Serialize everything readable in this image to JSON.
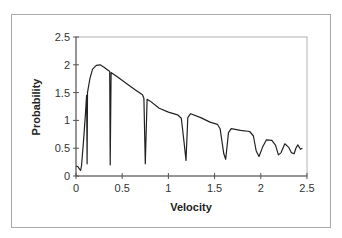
{
  "chart_data": {
    "type": "line",
    "title": "",
    "xlabel": "Velocity",
    "ylabel": "Probability",
    "xlim": [
      0,
      2.5
    ],
    "ylim": [
      0,
      2.5
    ],
    "x_ticks": [
      "0",
      "0.5",
      "1",
      "1.5",
      "2",
      "2.5"
    ],
    "y_ticks": [
      "0",
      "0.5",
      "1",
      "1.5",
      "2",
      "2.5"
    ],
    "grid": false,
    "legend": null,
    "series": [
      {
        "name": "Probability",
        "color": "#222222",
        "points": [
          [
            0.0,
            0.18
          ],
          [
            0.02,
            0.17
          ],
          [
            0.04,
            0.12
          ],
          [
            0.05,
            0.1
          ],
          [
            0.06,
            0.18
          ],
          [
            0.08,
            0.6
          ],
          [
            0.1,
            1.05
          ],
          [
            0.115,
            1.45
          ],
          [
            0.12,
            0.22
          ],
          [
            0.125,
            1.5
          ],
          [
            0.15,
            1.75
          ],
          [
            0.18,
            1.92
          ],
          [
            0.22,
            1.99
          ],
          [
            0.26,
            2.0
          ],
          [
            0.3,
            1.96
          ],
          [
            0.35,
            1.9
          ],
          [
            0.365,
            1.88
          ],
          [
            0.37,
            0.2
          ],
          [
            0.38,
            1.86
          ],
          [
            0.45,
            1.78
          ],
          [
            0.55,
            1.66
          ],
          [
            0.65,
            1.54
          ],
          [
            0.72,
            1.46
          ],
          [
            0.735,
            1.4
          ],
          [
            0.75,
            0.22
          ],
          [
            0.77,
            1.38
          ],
          [
            0.8,
            1.35
          ],
          [
            0.9,
            1.22
          ],
          [
            1.0,
            1.15
          ],
          [
            1.1,
            1.1
          ],
          [
            1.14,
            1.04
          ],
          [
            1.17,
            0.6
          ],
          [
            1.19,
            0.28
          ],
          [
            1.21,
            1.05
          ],
          [
            1.24,
            1.12
          ],
          [
            1.35,
            1.05
          ],
          [
            1.45,
            0.97
          ],
          [
            1.53,
            0.93
          ],
          [
            1.56,
            0.85
          ],
          [
            1.6,
            0.4
          ],
          [
            1.62,
            0.3
          ],
          [
            1.65,
            0.78
          ],
          [
            1.68,
            0.85
          ],
          [
            1.78,
            0.82
          ],
          [
            1.88,
            0.8
          ],
          [
            1.92,
            0.72
          ],
          [
            1.95,
            0.45
          ],
          [
            1.98,
            0.35
          ],
          [
            2.02,
            0.52
          ],
          [
            2.06,
            0.65
          ],
          [
            2.12,
            0.64
          ],
          [
            2.16,
            0.55
          ],
          [
            2.19,
            0.38
          ],
          [
            2.22,
            0.42
          ],
          [
            2.26,
            0.58
          ],
          [
            2.3,
            0.52
          ],
          [
            2.33,
            0.42
          ],
          [
            2.36,
            0.4
          ],
          [
            2.38,
            0.5
          ],
          [
            2.4,
            0.56
          ],
          [
            2.43,
            0.48
          ],
          [
            2.45,
            0.5
          ]
        ]
      }
    ]
  }
}
